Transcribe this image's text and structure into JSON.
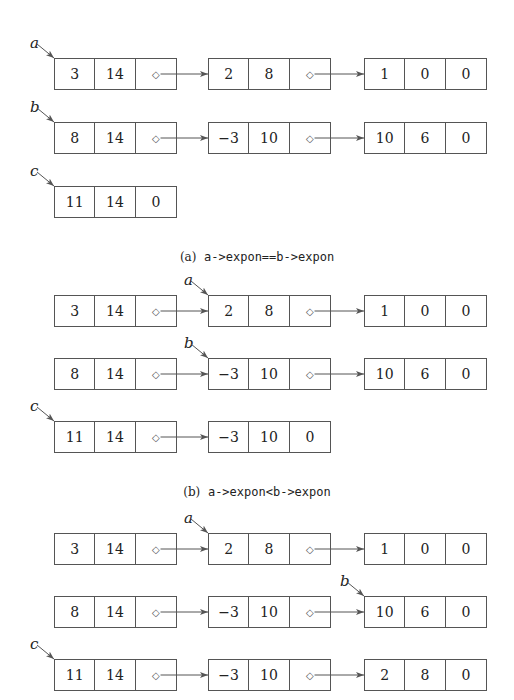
{
  "figure": {
    "columns_x": [
      54,
      208,
      364
    ],
    "sections": [
      {
        "caption_label": "(a)",
        "caption_code": "a->expon==b->expon",
        "caption_y": 250,
        "rows": [
          {
            "name": "a",
            "y": 58,
            "label": "a",
            "label_node": 0,
            "nodes": [
              [
                "3",
                "14",
                "◇"
              ],
              [
                "2",
                "8",
                "◇"
              ],
              [
                "1",
                "0",
                "0"
              ]
            ]
          },
          {
            "name": "b",
            "y": 122,
            "label": "b",
            "label_node": 0,
            "nodes": [
              [
                "8",
                "14",
                "◇"
              ],
              [
                "−3",
                "10",
                "◇"
              ],
              [
                "10",
                "6",
                "0"
              ]
            ]
          },
          {
            "name": "c",
            "y": 186,
            "label": "c",
            "label_node": 0,
            "nodes": [
              [
                "11",
                "14",
                "0"
              ]
            ]
          }
        ]
      },
      {
        "caption_label": "(b)",
        "caption_code": "a->expon<b->expon",
        "caption_y": 485,
        "rows": [
          {
            "name": "a",
            "y": 295,
            "label": "a",
            "label_node": 1,
            "nodes": [
              [
                "3",
                "14",
                "◇"
              ],
              [
                "2",
                "8",
                "◇"
              ],
              [
                "1",
                "0",
                "0"
              ]
            ]
          },
          {
            "name": "b",
            "y": 358,
            "label": "b",
            "label_node": 1,
            "nodes": [
              [
                "8",
                "14",
                "◇"
              ],
              [
                "−3",
                "10",
                "◇"
              ],
              [
                "10",
                "6",
                "0"
              ]
            ]
          },
          {
            "name": "c",
            "y": 421,
            "label": "c",
            "label_node": 0,
            "nodes": [
              [
                "11",
                "14",
                "◇"
              ],
              [
                "−3",
                "10",
                "0"
              ]
            ]
          }
        ]
      },
      {
        "caption_label": "",
        "caption_code": "",
        "caption_y": null,
        "rows": [
          {
            "name": "a",
            "y": 533,
            "label": "a",
            "label_node": 1,
            "nodes": [
              [
                "3",
                "14",
                "◇"
              ],
              [
                "2",
                "8",
                "◇"
              ],
              [
                "1",
                "0",
                "0"
              ]
            ]
          },
          {
            "name": "b",
            "y": 596,
            "label": "b",
            "label_node": 2,
            "nodes": [
              [
                "8",
                "14",
                "◇"
              ],
              [
                "−3",
                "10",
                "◇"
              ],
              [
                "10",
                "6",
                "0"
              ]
            ]
          },
          {
            "name": "c",
            "y": 659,
            "label": "c",
            "label_node": 0,
            "nodes": [
              [
                "11",
                "14",
                "◇"
              ],
              [
                "−3",
                "10",
                "◇"
              ],
              [
                "2",
                "8",
                "0"
              ]
            ]
          }
        ]
      }
    ]
  }
}
